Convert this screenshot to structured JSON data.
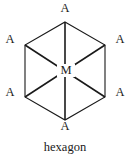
{
  "figure": {
    "caption": "hexagon",
    "center": {
      "label": "M",
      "x": 65,
      "y": 71
    },
    "stroke_color": "#1a1a1a",
    "background_color": "#ffffff",
    "hexagon": {
      "vertices": [
        {
          "name": "top",
          "label": "A",
          "x": 65,
          "y": 22,
          "label_x": 65,
          "label_y": 8
        },
        {
          "name": "upper-right",
          "label": "A",
          "x": 105,
          "y": 45,
          "label_x": 120,
          "label_y": 39
        },
        {
          "name": "lower-right",
          "label": "A",
          "x": 105,
          "y": 97,
          "label_x": 120,
          "label_y": 92
        },
        {
          "name": "bottom",
          "label": "A",
          "x": 65,
          "y": 120,
          "label_x": 65,
          "label_y": 126
        },
        {
          "name": "lower-left",
          "label": "A",
          "x": 25,
          "y": 97,
          "label_x": 10,
          "label_y": 92
        },
        {
          "name": "upper-left",
          "label": "A",
          "x": 25,
          "y": 45,
          "label_x": 10,
          "label_y": 39
        }
      ]
    }
  }
}
